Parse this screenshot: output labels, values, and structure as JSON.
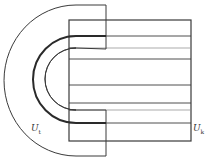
{
  "diagram": {
    "labels": {
      "left_core": {
        "main": "U",
        "sub": "t"
      },
      "right_core": {
        "main": "U",
        "sub": "k"
      }
    },
    "colors": {
      "stroke": "#3a3a3a",
      "background": "#ffffff"
    }
  }
}
